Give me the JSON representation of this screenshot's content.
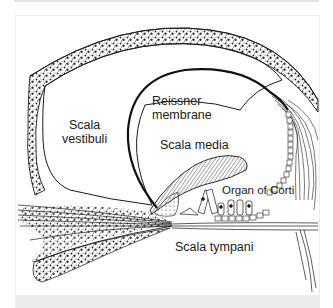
{
  "figure": {
    "type": "anatomical cross-section of the cochlear duct",
    "colors": {
      "background": "#ffffff",
      "ink": "#1a1a1a",
      "panel_border": "#ececec",
      "caption_strip": "#ececec"
    },
    "labels": {
      "scala_vestibuli_line1": "Scala",
      "scala_vestibuli_line2": "vestibuli",
      "reissner_line1": "Reissner",
      "reissner_line2": "membrane",
      "scala_media": "Scala media",
      "organ_of_corti": "Organ of Corti",
      "scala_tympani": "Scala tympani"
    }
  }
}
